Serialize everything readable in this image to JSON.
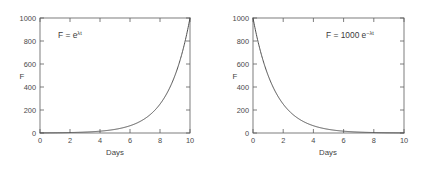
{
  "figure": {
    "background_color": "#ffffff",
    "axis_color": "#5d5d5d",
    "curve_color": "#4d4d4d",
    "text_color": "#4a4a4a"
  },
  "chart_data": [
    {
      "type": "line",
      "panel": "left",
      "title": "",
      "xlabel": "Days",
      "ylabel": "F",
      "xlim": [
        0,
        10
      ],
      "ylim": [
        0,
        1000
      ],
      "xticks": [
        0,
        2,
        4,
        6,
        8,
        10
      ],
      "yticks": [
        0,
        200,
        400,
        600,
        800,
        1000
      ],
      "xticklabels": [
        "0",
        "2",
        "4",
        "6",
        "8",
        "10"
      ],
      "yticklabels": [
        "0",
        "200",
        "400",
        "600",
        "800",
        "1000"
      ],
      "grid": false,
      "legend": null,
      "annotation": {
        "prefix": "F = e",
        "superscript": "λt",
        "full": "F = e^(λt)"
      },
      "equation": "F = e^(λ t)",
      "lambda": 0.6908,
      "series": [
        {
          "name": "exponential growth",
          "x": [
            0,
            0.5,
            1,
            1.5,
            2,
            2.5,
            3,
            3.5,
            4,
            4.5,
            5,
            5.5,
            6,
            6.5,
            7,
            7.5,
            8,
            8.5,
            9,
            9.5,
            10
          ],
          "values": [
            1,
            1.4,
            2,
            2.8,
            4,
            5.6,
            7.9,
            11.2,
            15.8,
            22.4,
            31.6,
            44.7,
            63.1,
            89.1,
            125.9,
            177.8,
            251.2,
            354.8,
            501.2,
            707.9,
            1000
          ]
        }
      ]
    },
    {
      "type": "line",
      "panel": "right",
      "title": "",
      "xlabel": "Days",
      "ylabel": "F",
      "xlim": [
        0,
        10
      ],
      "ylim": [
        0,
        1000
      ],
      "xticks": [
        0,
        2,
        4,
        6,
        8,
        10
      ],
      "yticks": [
        0,
        200,
        400,
        600,
        800,
        1000
      ],
      "xticklabels": [
        "0",
        "2",
        "4",
        "6",
        "8",
        "10"
      ],
      "yticklabels": [
        "0",
        "200",
        "400",
        "600",
        "800",
        "1000"
      ],
      "grid": false,
      "legend": null,
      "annotation": {
        "prefix": "F = 1000 e",
        "superscript": "−λt",
        "full": "F = 1000 e^(−λt)"
      },
      "equation": "F = 1000 e^(−λ t)",
      "lambda": 0.6908,
      "series": [
        {
          "name": "exponential decay",
          "x": [
            0,
            0.5,
            1,
            1.5,
            2,
            2.5,
            3,
            3.5,
            4,
            4.5,
            5,
            5.5,
            6,
            6.5,
            7,
            7.5,
            8,
            8.5,
            9,
            9.5,
            10
          ],
          "values": [
            1000,
            707.9,
            501.2,
            354.8,
            251.2,
            177.8,
            125.9,
            89.1,
            63.1,
            44.7,
            31.6,
            22.4,
            15.8,
            11.2,
            7.9,
            5.6,
            4,
            2.8,
            2,
            1.4,
            1
          ]
        }
      ]
    }
  ]
}
